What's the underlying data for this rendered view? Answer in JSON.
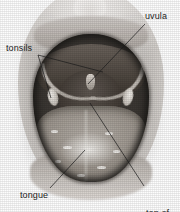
{
  "figure": {
    "type": "anatomical-photograph",
    "rendering": "grayscale photograph with leader-line callouts",
    "width": 180,
    "height": 212,
    "background_color": "#ffffff",
    "label_color": "#1c1c1c",
    "leader_line_color": "#1a1a1a"
  },
  "labels": [
    {
      "id": "uvula",
      "text": "uvula",
      "position": "top-right",
      "leader": {
        "from_x": 145,
        "from_y": 24,
        "to_x": 88,
        "to_y": 84
      }
    },
    {
      "id": "tonsils",
      "text": "tonsils",
      "position": "left",
      "leader_count": 2,
      "leader_a": {
        "from_x": 38,
        "from_y": 55,
        "to_x": 103,
        "to_y": 72
      },
      "leader_b": {
        "from_x": 38,
        "from_y": 55,
        "to_x": 51,
        "to_y": 98
      }
    },
    {
      "id": "tongue",
      "text": "tongue",
      "position": "bottom-left",
      "leader": {
        "from_x": 50,
        "from_y": 188,
        "to_x": 85,
        "to_y": 150
      }
    },
    {
      "id": "top-of-pharynx",
      "text": "top of\npharynx",
      "line1": "top of",
      "line2": "pharynx",
      "position": "bottom-right",
      "leader": {
        "from_x": 144,
        "from_y": 186,
        "to_x": 90,
        "to_y": 103
      }
    }
  ],
  "anatomy_parts": [
    {
      "name": "nose",
      "visible": true
    },
    {
      "name": "upper-lip",
      "visible": true
    },
    {
      "name": "upper-teeth",
      "visible": true
    },
    {
      "name": "soft-palate",
      "visible": true
    },
    {
      "name": "uvula",
      "visible": true
    },
    {
      "name": "left-tonsil",
      "visible": true
    },
    {
      "name": "right-tonsil",
      "visible": true
    },
    {
      "name": "pharynx",
      "visible": true
    },
    {
      "name": "tongue",
      "visible": true
    },
    {
      "name": "lower-lip",
      "visible": true
    }
  ]
}
